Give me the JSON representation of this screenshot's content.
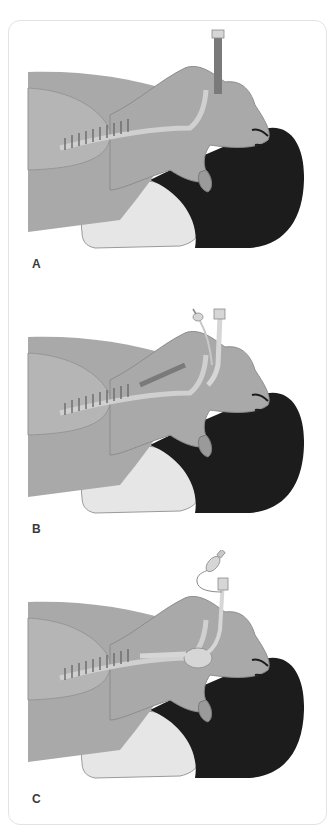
{
  "figure": {
    "panels": [
      {
        "label": "A",
        "device": "oropharyngeal-tube"
      },
      {
        "label": "B",
        "device": "cuffed-supraglottic-tube"
      },
      {
        "label": "C",
        "device": "cuffed-endotracheal-tube"
      }
    ],
    "colors": {
      "skin": "#a9a9a9",
      "skin_dark": "#8f8f8f",
      "skin_light": "#c4c4c4",
      "hair": "#1c1c1c",
      "pillow": "#e6e6e6",
      "frame_border": "#e3e3e3",
      "tube_a": "#7a7a7a",
      "tube_light": "#d6d6d6",
      "label": "#3a3a3a"
    }
  }
}
